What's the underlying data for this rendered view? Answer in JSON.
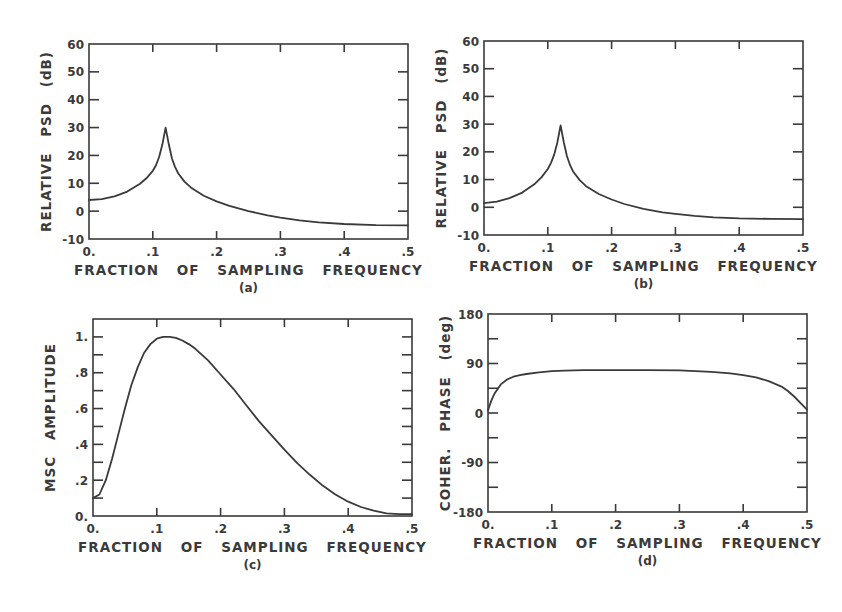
{
  "figure": {
    "ink_color": "#3a3a3a",
    "background": "#ffffff",
    "panels": [
      {
        "id": "a",
        "caption": "(a)",
        "frame": {
          "left": 89,
          "top": 44,
          "right": 408,
          "bottom": 239
        },
        "xlabel": "FRACTION OF SAMPLING FREQUENCY",
        "ylabel": "RELATIVE PSD (dB)",
        "xticks": [
          0,
          0.1,
          0.2,
          0.3,
          0.4,
          0.5
        ],
        "xtick_labels": [
          "0.",
          ".1",
          ".2",
          ".3",
          ".4",
          ".5"
        ],
        "yticks": [
          -10,
          0,
          10,
          20,
          30,
          40,
          50,
          60
        ],
        "ytick_labels": [
          "-10",
          "0",
          "10",
          "20",
          "30",
          "40",
          "50",
          "60"
        ],
        "yminor": [],
        "xlim": [
          0,
          0.5
        ],
        "ylim": [
          -10,
          60
        ]
      },
      {
        "id": "b",
        "caption": "(b)",
        "frame": {
          "left": 484,
          "top": 41,
          "right": 803,
          "bottom": 235
        },
        "xlabel": "FRACTION OF SAMPLING FREQUENCY",
        "ylabel": "RELATIVE PSD (dB)",
        "xticks": [
          0,
          0.1,
          0.2,
          0.3,
          0.4,
          0.5
        ],
        "xtick_labels": [
          "0.",
          ".1",
          ".2",
          ".3",
          ".4",
          ".5"
        ],
        "yticks": [
          -10,
          0,
          10,
          20,
          30,
          40,
          50,
          60
        ],
        "ytick_labels": [
          "-10",
          "0",
          "10",
          "20",
          "30",
          "40",
          "50",
          "60"
        ],
        "yminor": [],
        "xlim": [
          0,
          0.5
        ],
        "ylim": [
          -10,
          60
        ]
      },
      {
        "id": "c",
        "caption": "(c)",
        "frame": {
          "left": 93,
          "top": 319,
          "right": 412,
          "bottom": 516
        },
        "xlabel": "FRACTION OF SAMPLING FREQUENCY",
        "ylabel": "MSC AMPLITUDE",
        "xticks": [
          0,
          0.1,
          0.2,
          0.3,
          0.4,
          0.5
        ],
        "xtick_labels": [
          "0.",
          ".1",
          ".2",
          ".3",
          ".4",
          ".5"
        ],
        "yticks": [
          0,
          0.2,
          0.4,
          0.6,
          0.8,
          1.0
        ],
        "ytick_labels": [
          "0.",
          ".2",
          ".4",
          ".6",
          ".8",
          "1."
        ],
        "yminor": [
          0.1,
          0.3,
          0.5,
          0.7,
          0.9
        ],
        "xlim": [
          0,
          0.5
        ],
        "ylim": [
          0,
          1.1
        ]
      },
      {
        "id": "d",
        "caption": "(d)",
        "frame": {
          "left": 488,
          "top": 314,
          "right": 807,
          "bottom": 512
        },
        "xlabel": "FRACTION OF SAMPLING FREQUENCY",
        "ylabel": "COHER. PHASE (deg)",
        "xticks": [
          0,
          0.1,
          0.2,
          0.3,
          0.4,
          0.5
        ],
        "xtick_labels": [
          "0.",
          ".1",
          ".2",
          ".3",
          ".4",
          ".5"
        ],
        "yticks": [
          -180,
          -90,
          0,
          90,
          180
        ],
        "ytick_labels": [
          "-180",
          "-90",
          "0",
          "90",
          "180"
        ],
        "yminor": [
          -135,
          -45,
          45,
          135
        ],
        "xlim": [
          0,
          0.5
        ],
        "ylim": [
          -180,
          180
        ]
      }
    ]
  },
  "chart_data": [
    {
      "type": "line",
      "title": "(a)",
      "xlabel": "FRACTION OF SAMPLING FREQUENCY",
      "ylabel": "RELATIVE PSD (dB)",
      "xlim": [
        0,
        0.5
      ],
      "ylim": [
        -10,
        60
      ],
      "grid": false,
      "series": [
        {
          "name": "PSD (a)",
          "x": [
            0.0,
            0.02,
            0.04,
            0.06,
            0.08,
            0.09,
            0.1,
            0.105,
            0.11,
            0.115,
            0.12,
            0.125,
            0.13,
            0.135,
            0.14,
            0.15,
            0.16,
            0.18,
            0.2,
            0.22,
            0.25,
            0.28,
            0.3,
            0.33,
            0.36,
            0.4,
            0.45,
            0.5
          ],
          "y": [
            4.0,
            4.3,
            5.3,
            7.0,
            9.8,
            11.8,
            14.5,
            16.5,
            19.5,
            24.0,
            30.0,
            24.0,
            19.0,
            15.8,
            13.5,
            10.5,
            8.4,
            5.5,
            3.5,
            1.9,
            0.0,
            -1.5,
            -2.3,
            -3.3,
            -4.0,
            -4.6,
            -5.0,
            -5.1
          ]
        }
      ]
    },
    {
      "type": "line",
      "title": "(b)",
      "xlabel": "FRACTION OF SAMPLING FREQUENCY",
      "ylabel": "RELATIVE PSD (dB)",
      "xlim": [
        0,
        0.5
      ],
      "ylim": [
        -10,
        60
      ],
      "grid": false,
      "series": [
        {
          "name": "PSD (b)",
          "x": [
            0.0,
            0.02,
            0.04,
            0.06,
            0.08,
            0.09,
            0.1,
            0.105,
            0.11,
            0.115,
            0.12,
            0.125,
            0.13,
            0.135,
            0.14,
            0.15,
            0.16,
            0.18,
            0.2,
            0.22,
            0.25,
            0.28,
            0.3,
            0.33,
            0.36,
            0.4,
            0.45,
            0.5
          ],
          "y": [
            1.5,
            2.0,
            3.3,
            5.3,
            8.5,
            10.8,
            13.8,
            16.0,
            19.0,
            23.5,
            29.5,
            23.5,
            18.5,
            15.2,
            12.8,
            9.8,
            7.6,
            4.8,
            2.8,
            1.2,
            -0.6,
            -1.8,
            -2.4,
            -3.1,
            -3.6,
            -4.0,
            -4.2,
            -4.3
          ]
        }
      ]
    },
    {
      "type": "line",
      "title": "(c)",
      "xlabel": "FRACTION OF SAMPLING FREQUENCY",
      "ylabel": "MSC AMPLITUDE",
      "xlim": [
        0,
        0.5
      ],
      "ylim": [
        0,
        1.1
      ],
      "grid": false,
      "series": [
        {
          "name": "MSC",
          "x": [
            0.0,
            0.01,
            0.02,
            0.03,
            0.04,
            0.05,
            0.06,
            0.07,
            0.08,
            0.09,
            0.1,
            0.11,
            0.12,
            0.13,
            0.14,
            0.15,
            0.16,
            0.18,
            0.2,
            0.22,
            0.24,
            0.26,
            0.28,
            0.3,
            0.32,
            0.34,
            0.36,
            0.38,
            0.4,
            0.42,
            0.44,
            0.46,
            0.48,
            0.5
          ],
          "y": [
            0.1,
            0.12,
            0.2,
            0.32,
            0.46,
            0.6,
            0.73,
            0.83,
            0.91,
            0.96,
            0.99,
            1.0,
            1.0,
            0.995,
            0.98,
            0.96,
            0.935,
            0.87,
            0.79,
            0.71,
            0.62,
            0.53,
            0.45,
            0.37,
            0.295,
            0.23,
            0.17,
            0.12,
            0.08,
            0.05,
            0.03,
            0.015,
            0.01,
            0.01
          ]
        }
      ]
    },
    {
      "type": "line",
      "title": "(d)",
      "xlabel": "FRACTION OF SAMPLING FREQUENCY",
      "ylabel": "COHER. PHASE (deg)",
      "xlim": [
        0,
        0.5
      ],
      "ylim": [
        -180,
        180
      ],
      "grid": false,
      "series": [
        {
          "name": "Coherence phase",
          "x": [
            0.0,
            0.005,
            0.01,
            0.02,
            0.03,
            0.04,
            0.05,
            0.06,
            0.08,
            0.1,
            0.12,
            0.15,
            0.2,
            0.25,
            0.3,
            0.35,
            0.38,
            0.4,
            0.42,
            0.44,
            0.46,
            0.47,
            0.48,
            0.49,
            0.495,
            0.5
          ],
          "y": [
            5,
            22,
            35,
            52,
            61,
            66,
            69,
            71,
            74,
            76,
            77,
            78,
            78,
            78,
            77.5,
            75,
            72,
            69,
            65,
            58,
            48,
            40,
            30,
            18,
            12,
            6
          ]
        }
      ]
    }
  ]
}
